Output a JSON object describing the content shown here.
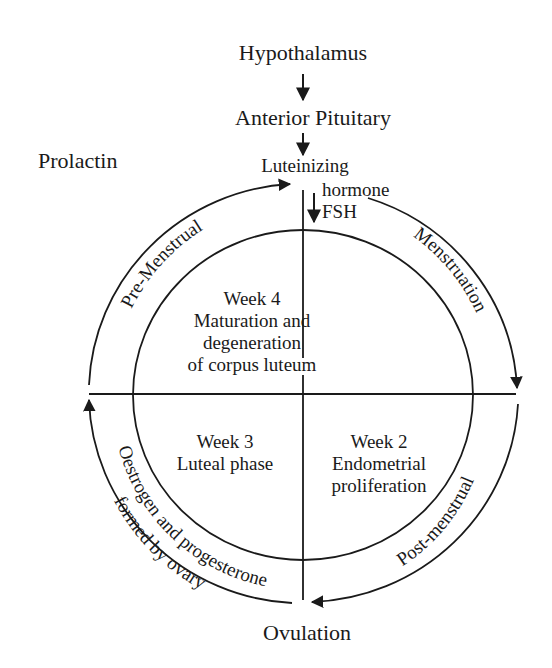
{
  "diagram": {
    "title_chain": {
      "hypothalamus": "Hypothalamus",
      "anterior_pituitary": "Anterior Pituitary",
      "luteinizing": "Luteinizing",
      "hormone": "hormone",
      "fsh": "FSH"
    },
    "prolactin": "Prolactin",
    "outer_arcs": {
      "pre_menstrual": "Pre-Menstrual",
      "menstruation": "Menstruation",
      "post_menstrual": "Post-menstrual",
      "oestrogen_line1": "Oestrogen and progesterone",
      "oestrogen_line2": "formed by ovary"
    },
    "quadrants": {
      "week4": {
        "title": "Week 4",
        "line1": "Maturation and",
        "line2": "degeneration",
        "line3": "of corpus luteum"
      },
      "week3": {
        "title": "Week 3",
        "line1": "Luteal phase"
      },
      "week2": {
        "title": "Week 2",
        "line1": "Endometrial",
        "line2": "proliferation"
      }
    },
    "bottom_label": "Ovulation",
    "colors": {
      "ink": "#1a1a1a",
      "background": "#ffffff"
    }
  }
}
